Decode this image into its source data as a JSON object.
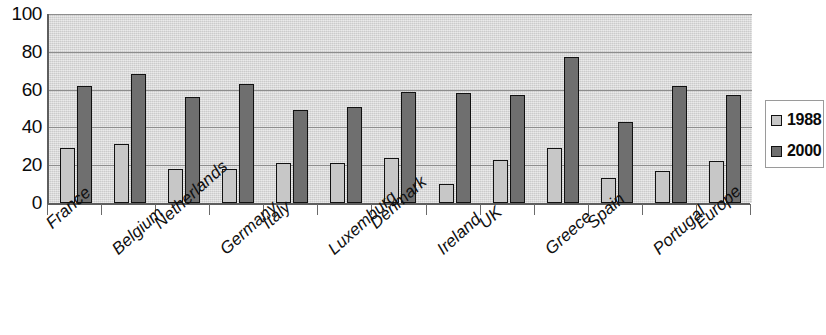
{
  "chart_data": {
    "type": "bar",
    "title": "",
    "subtitle": "",
    "xlabel": "",
    "ylabel": "",
    "ylim": [
      0,
      100
    ],
    "yticks": [
      0,
      20,
      40,
      60,
      80,
      100
    ],
    "ytick_labels": [
      "0",
      "20",
      "40",
      "60",
      "80",
      "100"
    ],
    "grid": true,
    "legend_position": "right",
    "categories": [
      "France",
      "Belgium",
      "Netherlands",
      "Germany",
      "Italy",
      "Luxemburg",
      "Denmark",
      "Ireland",
      "UK",
      "Greece",
      "Spain",
      "Portugal",
      "Europe"
    ],
    "series": [
      {
        "name": "1988",
        "color": "#c7c7c7",
        "values": [
          29,
          31,
          18,
          18,
          21,
          21,
          24,
          10,
          23,
          29,
          13,
          17,
          22
        ]
      },
      {
        "name": "2000",
        "color": "#6f6f6f",
        "values": [
          62,
          68,
          56,
          63,
          49,
          51,
          59,
          58,
          57,
          77,
          43,
          62,
          57
        ]
      }
    ]
  },
  "legend": {
    "items": [
      {
        "label": "1988"
      },
      {
        "label": "2000"
      }
    ]
  },
  "colors": {
    "plot_background": "#d9d9d9",
    "gridline": "#8d8d8d",
    "axis": "#5e5e5e",
    "bar_outline": "#111111",
    "series_1988": "#c7c7c7",
    "series_2000": "#6f6f6f"
  }
}
